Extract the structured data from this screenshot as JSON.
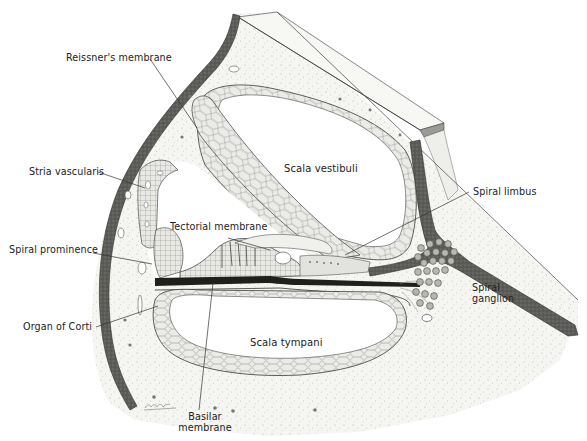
{
  "figure": {
    "colors": {
      "background": "#ffffff",
      "bone_fill": "#f3f3ef",
      "bone_stipple": "#b8b8b0",
      "outer_wall": "#4a4a48",
      "membrane_fill": "#e4e4e0",
      "cell_line": "#6a6a66",
      "ink": "#222222",
      "ganglion_cell": "#8c8c88"
    }
  },
  "labels": {
    "reissners_membrane": "Reissner's membrane",
    "stria_vascularis": "Stria vascularis",
    "tectorial_membrane": "Tectorial membrane",
    "spiral_prominence": "Spiral prominence",
    "organ_of_corti": "Organ of Corti",
    "basilar_membrane": "Basilar\nmembrane",
    "scala_vestibuli": "Scala vestibuli",
    "scala_tympani": "Scala tympani",
    "spiral_limbus": "Spiral limbus",
    "spiral_ganglion": "Spiral\nganglion"
  },
  "artist_signature": "artist-signature"
}
